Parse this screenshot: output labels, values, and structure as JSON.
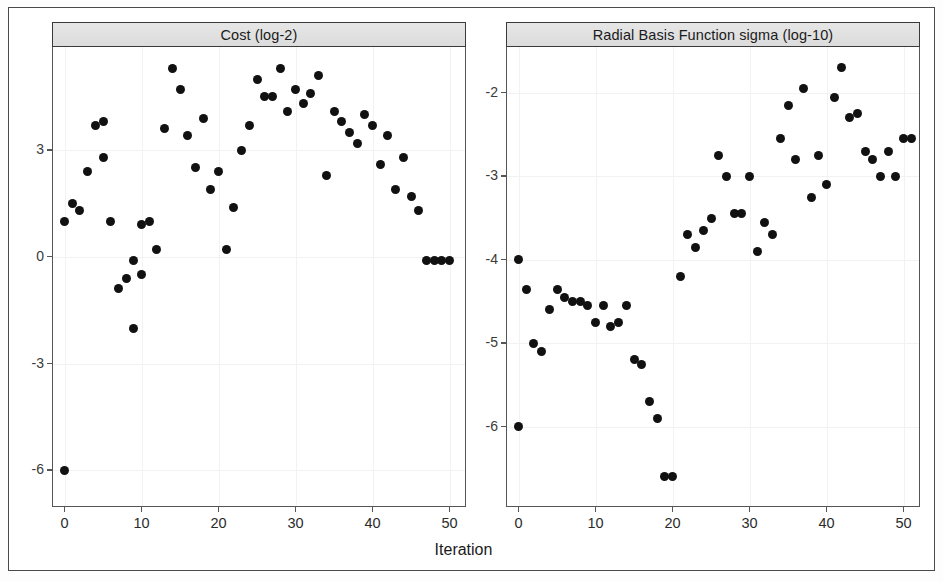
{
  "figure": {
    "xlabel": "Iteration",
    "point_color": "#111111",
    "strip_background": "#e2e2e2",
    "frame_color": "#4a4a4a"
  },
  "panels": [
    {
      "id": "cost",
      "title": "Cost (log-2)",
      "y_ticks": [
        "3",
        "0",
        "-3",
        "-6"
      ],
      "x_ticks": [
        "0",
        "10",
        "20",
        "30",
        "40",
        "50"
      ]
    },
    {
      "id": "sigma",
      "title": "Radial Basis Function sigma (log-10)",
      "y_ticks": [
        "-2",
        "-3",
        "-4",
        "-5",
        "-6"
      ],
      "x_ticks": [
        "0",
        "10",
        "20",
        "30",
        "40",
        "50"
      ]
    }
  ],
  "chart_data": [
    {
      "type": "scatter",
      "title": "Cost (log-2)",
      "xlabel": "Iteration",
      "ylabel": "Cost (log-2)",
      "xlim": [
        -1.5,
        52
      ],
      "ylim": [
        -7.0,
        5.9
      ],
      "y_ticks": [
        3,
        0,
        -3,
        -6
      ],
      "x_ticks": [
        0,
        10,
        20,
        30,
        40,
        50
      ],
      "grid": true,
      "legend": null,
      "x": [
        0,
        0,
        1,
        2,
        3,
        4,
        5,
        5,
        6,
        7,
        8,
        9,
        9,
        10,
        10,
        11,
        12,
        13,
        14,
        15,
        16,
        17,
        18,
        19,
        20,
        21,
        22,
        23,
        24,
        25,
        26,
        27,
        28,
        29,
        30,
        31,
        32,
        33,
        34,
        35,
        36,
        37,
        38,
        39,
        40,
        41,
        42,
        43,
        44,
        45,
        46,
        47,
        48,
        49,
        50
      ],
      "y": [
        -6.0,
        1.0,
        1.5,
        1.3,
        2.4,
        3.7,
        3.8,
        2.8,
        1.0,
        -0.9,
        -0.6,
        -2.0,
        -0.1,
        0.9,
        -0.5,
        1.0,
        0.2,
        3.6,
        5.3,
        4.7,
        3.4,
        2.5,
        3.9,
        1.9,
        2.4,
        0.2,
        1.4,
        3.0,
        3.7,
        5.0,
        4.5,
        4.5,
        5.3,
        4.1,
        4.7,
        4.3,
        4.6,
        5.1,
        2.3,
        4.1,
        3.8,
        3.5,
        3.2,
        4.0,
        3.7,
        2.6,
        3.4,
        1.9,
        2.8,
        1.7,
        1.3,
        -0.1,
        -0.1,
        -0.1,
        -0.1
      ]
    },
    {
      "type": "scatter",
      "title": "Radial Basis Function sigma (log-10)",
      "xlabel": "Iteration",
      "ylabel": "Radial Basis Function sigma (log-10)",
      "xlim": [
        -1.5,
        52
      ],
      "ylim": [
        -6.95,
        -1.45
      ],
      "y_ticks": [
        -2,
        -3,
        -4,
        -5,
        -6
      ],
      "x_ticks": [
        0,
        10,
        20,
        30,
        40,
        50
      ],
      "grid": true,
      "legend": null,
      "x": [
        0,
        0,
        1,
        2,
        3,
        4,
        5,
        6,
        7,
        8,
        9,
        10,
        11,
        12,
        13,
        14,
        15,
        16,
        17,
        18,
        19,
        20,
        21,
        22,
        23,
        24,
        25,
        26,
        27,
        28,
        29,
        30,
        31,
        32,
        33,
        34,
        35,
        36,
        37,
        38,
        39,
        40,
        41,
        42,
        43,
        44,
        45,
        46,
        47,
        48,
        49,
        50,
        51
      ],
      "y": [
        -4.0,
        -6.0,
        -4.35,
        -5.0,
        -5.1,
        -4.6,
        -4.35,
        -4.45,
        -4.5,
        -4.5,
        -4.55,
        -4.75,
        -4.55,
        -4.8,
        -4.75,
        -4.55,
        -5.2,
        -5.25,
        -5.7,
        -5.9,
        -6.6,
        -6.6,
        -4.2,
        -3.7,
        -3.85,
        -3.65,
        -3.5,
        -2.75,
        -3.0,
        -3.45,
        -3.45,
        -3.0,
        -3.9,
        -3.55,
        -3.7,
        -2.55,
        -2.15,
        -2.8,
        -1.95,
        -3.25,
        -2.75,
        -3.1,
        -2.05,
        -1.7,
        -2.3,
        -2.25,
        -2.7,
        -2.8,
        -3.0,
        -2.7,
        -3.0,
        -2.55,
        -2.55
      ]
    }
  ]
}
